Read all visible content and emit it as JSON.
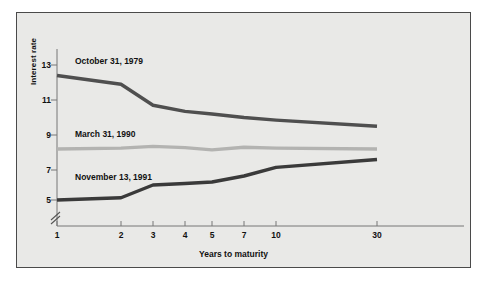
{
  "figure": {
    "background_color": "#e9e9e7",
    "border_color": "#4a4a4a",
    "page_background": "#ffffff"
  },
  "chart_data": {
    "type": "line",
    "title": "",
    "xlabel": "Years to maturity",
    "ylabel": "Interest rate",
    "x": [
      1,
      2,
      3,
      4,
      5,
      7,
      10,
      30
    ],
    "xtick_labels": [
      "1",
      "2",
      "3",
      "4",
      "5",
      "7",
      "10",
      "30"
    ],
    "ytick_labels": [
      "5",
      "7",
      "9",
      "11",
      "13"
    ],
    "ytick_values": [
      5,
      7,
      9,
      11,
      13
    ],
    "ylim": [
      4.6,
      13.6
    ],
    "y_axis_break": true,
    "grid": false,
    "legend_position": "inline-annotations",
    "series": [
      {
        "name": "October 31, 1979",
        "color": "#4f4f4f",
        "values": [
          12.4,
          11.9,
          10.7,
          10.35,
          10.2,
          10.0,
          9.85,
          9.5
        ],
        "label_x": 2,
        "label_y": 13.15
      },
      {
        "name": "March 31, 1990",
        "color": "#b3b3b1",
        "values": [
          8.2,
          8.25,
          8.35,
          8.28,
          8.15,
          8.3,
          8.25,
          8.2
        ],
        "label_x": 2,
        "label_y": 9.0
      },
      {
        "name": "November 13, 1991",
        "color": "#3a3a3a",
        "values": [
          5.0,
          5.15,
          6.0,
          6.1,
          6.2,
          6.6,
          7.15,
          7.6
        ],
        "label_x": 2,
        "label_y": 6.45
      }
    ]
  }
}
